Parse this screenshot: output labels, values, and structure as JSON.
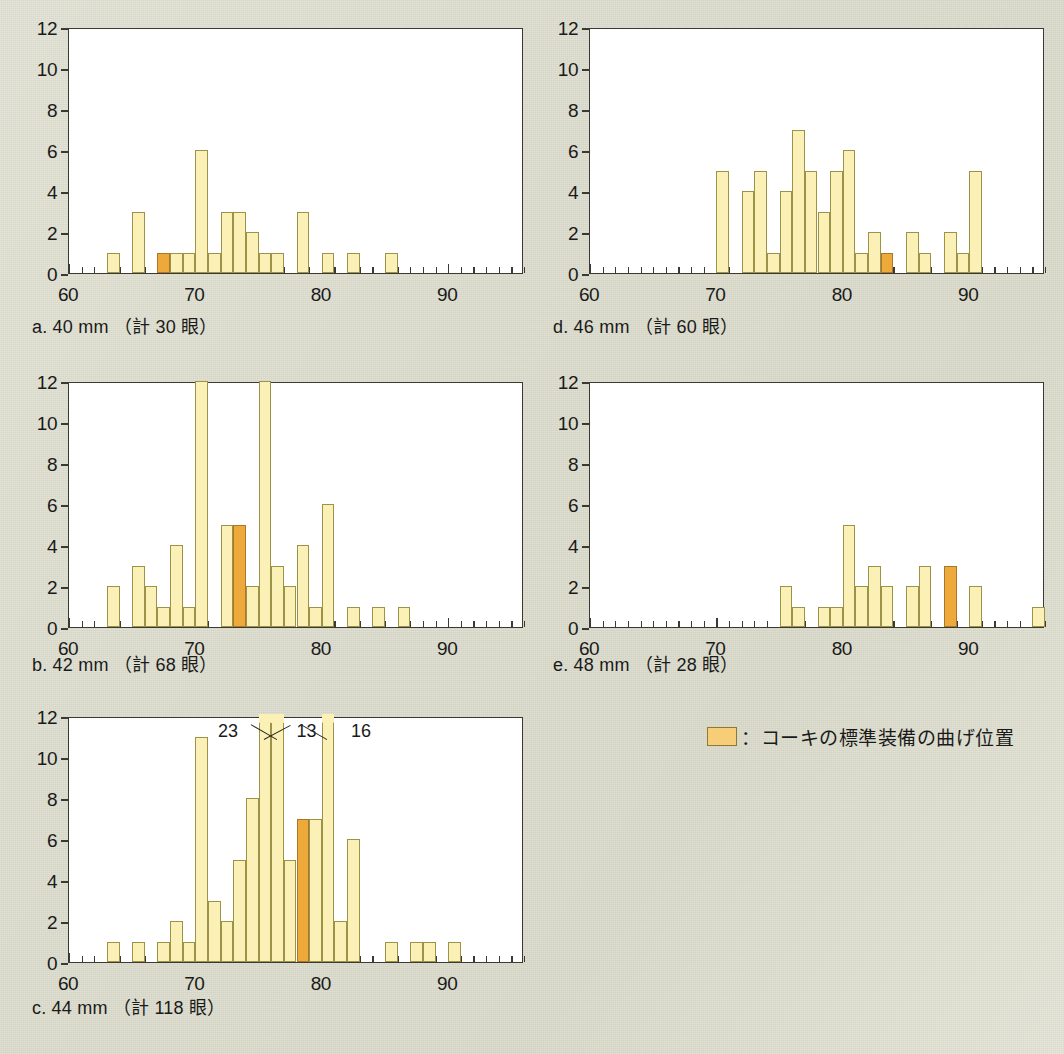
{
  "figure": {
    "background_color": "#dcdccd",
    "bar_color": "#fbf1b7",
    "highlight_color": "#eda93a",
    "axis_color": "#3a3a33"
  },
  "legend": {
    "swatch_name": "highlight-swatch",
    "text": "：コーキの標準装備の曲げ位置"
  },
  "axis": {
    "xlim": [
      60,
      96
    ],
    "ylim": [
      0,
      12
    ],
    "x_major_ticks": [
      60,
      70,
      80,
      90
    ],
    "x_major_labels": [
      "60",
      "70",
      "80",
      "90"
    ],
    "y_ticks": [
      0,
      2,
      4,
      6,
      8,
      10,
      12
    ],
    "y_labels": [
      "0",
      "2",
      "4",
      "6",
      "8",
      "10",
      "12"
    ],
    "x_minor_step": 1
  },
  "panels": [
    {
      "id": "a",
      "caption": "a.  40 mm （計 30 眼）",
      "label": "a.",
      "size_mm": "40 mm",
      "count_text": "（計 30 眼）",
      "total": 30,
      "highlight_x": 67,
      "bars": [
        {
          "x": 63,
          "y": 1
        },
        {
          "x": 65,
          "y": 3
        },
        {
          "x": 67,
          "y": 1
        },
        {
          "x": 68,
          "y": 1
        },
        {
          "x": 69,
          "y": 1
        },
        {
          "x": 70,
          "y": 6
        },
        {
          "x": 71,
          "y": 1
        },
        {
          "x": 72,
          "y": 3
        },
        {
          "x": 73,
          "y": 3
        },
        {
          "x": 74,
          "y": 2
        },
        {
          "x": 75,
          "y": 1
        },
        {
          "x": 76,
          "y": 1
        },
        {
          "x": 78,
          "y": 3
        },
        {
          "x": 80,
          "y": 1
        },
        {
          "x": 82,
          "y": 1
        },
        {
          "x": 85,
          "y": 1
        }
      ]
    },
    {
      "id": "b",
      "caption": "b.  42 mm （計 68 眼）",
      "label": "b.",
      "size_mm": "42 mm",
      "count_text": "（計 68 眼）",
      "total": 68,
      "highlight_x": 73,
      "bars": [
        {
          "x": 63,
          "y": 2
        },
        {
          "x": 65,
          "y": 3
        },
        {
          "x": 66,
          "y": 2
        },
        {
          "x": 67,
          "y": 1
        },
        {
          "x": 68,
          "y": 4
        },
        {
          "x": 69,
          "y": 1
        },
        {
          "x": 70,
          "y": 12
        },
        {
          "x": 72,
          "y": 5
        },
        {
          "x": 73,
          "y": 5
        },
        {
          "x": 74,
          "y": 2
        },
        {
          "x": 75,
          "y": 12
        },
        {
          "x": 76,
          "y": 3
        },
        {
          "x": 77,
          "y": 2
        },
        {
          "x": 78,
          "y": 4
        },
        {
          "x": 79,
          "y": 1
        },
        {
          "x": 80,
          "y": 6
        },
        {
          "x": 82,
          "y": 1
        },
        {
          "x": 84,
          "y": 1
        },
        {
          "x": 86,
          "y": 1
        }
      ]
    },
    {
      "id": "c",
      "caption": "c.  44 mm （計 118 眼）",
      "label": "c.",
      "size_mm": "44 mm",
      "count_text": "（計 118 眼）",
      "total": 118,
      "highlight_x": 78,
      "annotations": [
        {
          "text": "23",
          "x": 75
        },
        {
          "text": "13",
          "x": 76
        },
        {
          "text": "16",
          "x": 80
        }
      ],
      "bars": [
        {
          "x": 63,
          "y": 1
        },
        {
          "x": 65,
          "y": 1
        },
        {
          "x": 67,
          "y": 1
        },
        {
          "x": 68,
          "y": 2
        },
        {
          "x": 69,
          "y": 1
        },
        {
          "x": 70,
          "y": 11
        },
        {
          "x": 71,
          "y": 3
        },
        {
          "x": 72,
          "y": 2
        },
        {
          "x": 73,
          "y": 5
        },
        {
          "x": 74,
          "y": 8
        },
        {
          "x": 75,
          "y": 23,
          "over": true
        },
        {
          "x": 76,
          "y": 13,
          "over": true
        },
        {
          "x": 77,
          "y": 5
        },
        {
          "x": 78,
          "y": 7
        },
        {
          "x": 79,
          "y": 7
        },
        {
          "x": 80,
          "y": 16,
          "over": true
        },
        {
          "x": 81,
          "y": 2
        },
        {
          "x": 82,
          "y": 6
        },
        {
          "x": 85,
          "y": 1
        },
        {
          "x": 87,
          "y": 1
        },
        {
          "x": 88,
          "y": 1
        },
        {
          "x": 90,
          "y": 1
        }
      ]
    },
    {
      "id": "d",
      "caption": "d.  46 mm （計 60 眼）",
      "label": "d.",
      "size_mm": "46 mm",
      "count_text": "（計 60 眼）",
      "total": 60,
      "highlight_x": 83,
      "bars": [
        {
          "x": 70,
          "y": 5
        },
        {
          "x": 72,
          "y": 4
        },
        {
          "x": 73,
          "y": 5
        },
        {
          "x": 74,
          "y": 1
        },
        {
          "x": 75,
          "y": 4
        },
        {
          "x": 76,
          "y": 7
        },
        {
          "x": 77,
          "y": 5
        },
        {
          "x": 78,
          "y": 3
        },
        {
          "x": 79,
          "y": 5
        },
        {
          "x": 80,
          "y": 6
        },
        {
          "x": 81,
          "y": 1
        },
        {
          "x": 82,
          "y": 2
        },
        {
          "x": 83,
          "y": 1
        },
        {
          "x": 85,
          "y": 2
        },
        {
          "x": 86,
          "y": 1
        },
        {
          "x": 88,
          "y": 2
        },
        {
          "x": 89,
          "y": 1
        },
        {
          "x": 90,
          "y": 5
        }
      ]
    },
    {
      "id": "e",
      "caption": "e.  48 mm （計 28 眼）",
      "label": "e.",
      "size_mm": "48 mm",
      "count_text": "（計 28 眼）",
      "total": 28,
      "highlight_x": 88,
      "bars": [
        {
          "x": 75,
          "y": 2
        },
        {
          "x": 76,
          "y": 1
        },
        {
          "x": 78,
          "y": 1
        },
        {
          "x": 79,
          "y": 1
        },
        {
          "x": 80,
          "y": 5
        },
        {
          "x": 81,
          "y": 2
        },
        {
          "x": 82,
          "y": 3
        },
        {
          "x": 83,
          "y": 2
        },
        {
          "x": 85,
          "y": 2
        },
        {
          "x": 86,
          "y": 3
        },
        {
          "x": 88,
          "y": 3
        },
        {
          "x": 90,
          "y": 2
        },
        {
          "x": 95,
          "y": 1
        }
      ]
    }
  ],
  "chart_data": {
    "type": "bar",
    "title": "",
    "xlabel": "",
    "ylabel": "",
    "xlim": [
      60,
      96
    ],
    "ylim": [
      0,
      12
    ],
    "grid": false,
    "legend_position": "bottom-right",
    "subplots": [
      {
        "panel": "a",
        "title": "a.  40 mm （計 30 眼）",
        "categories": [
          63,
          65,
          67,
          68,
          69,
          70,
          71,
          72,
          73,
          74,
          75,
          76,
          78,
          80,
          82,
          85
        ],
        "values": [
          1,
          3,
          1,
          1,
          1,
          6,
          1,
          3,
          3,
          2,
          1,
          1,
          3,
          1,
          1,
          1
        ],
        "highlighted_category": 67
      },
      {
        "panel": "b",
        "title": "b.  42 mm （計 68 眼）",
        "categories": [
          63,
          65,
          66,
          67,
          68,
          69,
          70,
          72,
          73,
          74,
          75,
          76,
          77,
          78,
          79,
          80,
          82,
          84,
          86
        ],
        "values": [
          2,
          3,
          2,
          1,
          4,
          1,
          12,
          5,
          5,
          2,
          12,
          3,
          2,
          4,
          1,
          6,
          1,
          1,
          1
        ],
        "highlighted_category": 73
      },
      {
        "panel": "c",
        "title": "c.  44 mm （計 118 眼）",
        "categories": [
          63,
          65,
          67,
          68,
          69,
          70,
          71,
          72,
          73,
          74,
          75,
          76,
          77,
          78,
          79,
          80,
          81,
          82,
          85,
          87,
          88,
          90
        ],
        "values": [
          1,
          1,
          1,
          2,
          1,
          11,
          3,
          2,
          5,
          8,
          23,
          13,
          5,
          7,
          7,
          16,
          2,
          6,
          1,
          1,
          1,
          1
        ],
        "highlighted_category": 78,
        "over_range_labels": [
          {
            "category": 75,
            "value": 23
          },
          {
            "category": 76,
            "value": 13
          },
          {
            "category": 80,
            "value": 16
          }
        ]
      },
      {
        "panel": "d",
        "title": "d.  46 mm （計 60 眼）",
        "categories": [
          70,
          72,
          73,
          74,
          75,
          76,
          77,
          78,
          79,
          80,
          81,
          82,
          83,
          85,
          86,
          88,
          89,
          90
        ],
        "values": [
          5,
          4,
          5,
          1,
          4,
          7,
          5,
          3,
          5,
          6,
          1,
          2,
          1,
          2,
          1,
          2,
          1,
          5
        ],
        "highlighted_category": 83
      },
      {
        "panel": "e",
        "title": "e.  48 mm （計 28 眼）",
        "categories": [
          75,
          76,
          78,
          79,
          80,
          81,
          82,
          83,
          85,
          86,
          88,
          90,
          95
        ],
        "values": [
          2,
          1,
          1,
          1,
          5,
          2,
          3,
          2,
          2,
          3,
          3,
          2,
          1
        ],
        "highlighted_category": 88
      }
    ]
  }
}
